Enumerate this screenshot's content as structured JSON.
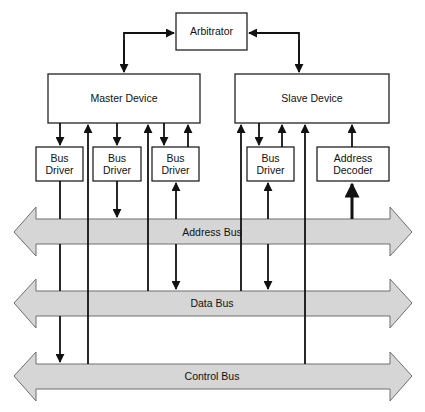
{
  "diagram": {
    "arbitrator": {
      "label": "Arbitrator"
    },
    "master": {
      "label": "Master Device"
    },
    "slave": {
      "label": "Slave Device"
    },
    "bus_drivers": [
      {
        "line1": "Bus",
        "line2": "Driver"
      },
      {
        "line1": "Bus",
        "line2": "Driver"
      },
      {
        "line1": "Bus",
        "line2": "Driver"
      },
      {
        "line1": "Bus",
        "line2": "Driver"
      }
    ],
    "address_decoder": {
      "line1": "Address",
      "line2": "Decoder"
    },
    "buses": [
      {
        "label": "Address Bus"
      },
      {
        "label": "Data Bus"
      },
      {
        "label": "Control Bus"
      }
    ],
    "colors": {
      "bus_fill": "#d6d6d6",
      "bus_stroke": "#6e6e6e",
      "line": "#111111"
    }
  }
}
